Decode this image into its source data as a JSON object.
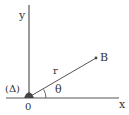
{
  "diagram": {
    "labels": {
      "y_axis": "y",
      "x_axis": "x",
      "origin": "0",
      "axis_name": "(Δ)",
      "point": "B",
      "radius": "r",
      "angle": "θ"
    },
    "colors": {
      "stroke": "#555555",
      "text": "#333333",
      "point": "#444444"
    }
  }
}
